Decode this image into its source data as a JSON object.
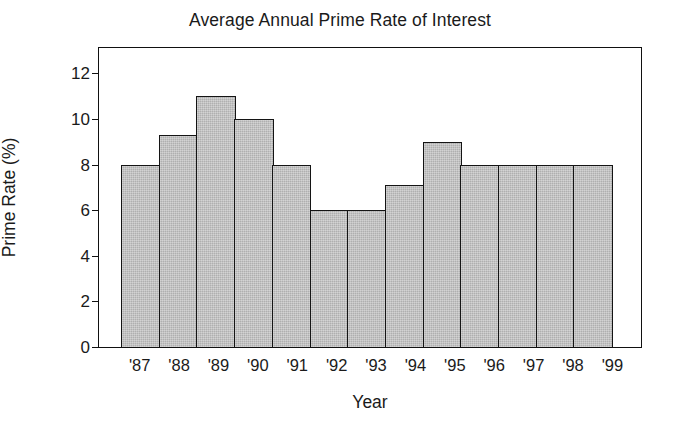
{
  "chart_data": {
    "type": "bar",
    "title": "Average Annual Prime Rate of Interest",
    "xlabel": "Year",
    "ylabel": "Prime Rate (%)",
    "categories": [
      "'87",
      "'88",
      "'89",
      "'90",
      "'91",
      "'92",
      "'93",
      "'94",
      "'95",
      "'96",
      "'97",
      "'98",
      "'99"
    ],
    "values": [
      8.0,
      9.3,
      11.0,
      10.0,
      8.0,
      6.0,
      6.0,
      7.1,
      9.0,
      8.0,
      8.0,
      8.0,
      8.0
    ],
    "ylim": [
      0,
      13.2
    ],
    "yticks": [
      0,
      2,
      4,
      6,
      8,
      10,
      12
    ],
    "ytick_labels": [
      "0",
      "2",
      "4",
      "6",
      "8",
      "10",
      "12"
    ],
    "grid": false,
    "legend": false,
    "bar_fill_color": "#b9b9b9",
    "bar_edge_color": "#141414",
    "background_color": "#ffffff",
    "text_color": "#1a1a1a"
  }
}
